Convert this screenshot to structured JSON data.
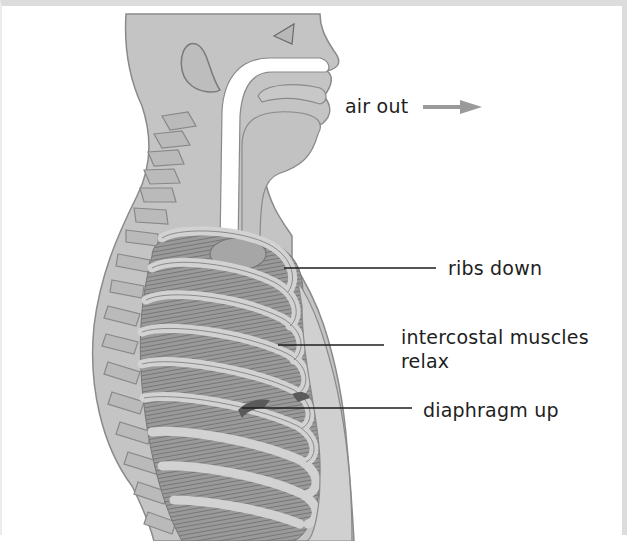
{
  "diagram": {
    "colors": {
      "body_fill": "#c4c4c4",
      "body_outline": "#8a8a8a",
      "rib_fill": "#cfcfcf",
      "muscle_fill": "#8e8e8e",
      "airway": "#ffffff",
      "diaphragm": "#5a5a5a",
      "leader_line": "#1e1e1e",
      "arrow": "#9a9a9a",
      "label_text": "#1e1e1e"
    },
    "labels": {
      "air_out": "air out",
      "ribs": "ribs down",
      "intercostal_line1": "intercostal muscles",
      "intercostal_line2": "relax",
      "diaphragm": "diaphragm up"
    },
    "icons": {
      "air_arrow": "right-arrow-icon"
    }
  }
}
